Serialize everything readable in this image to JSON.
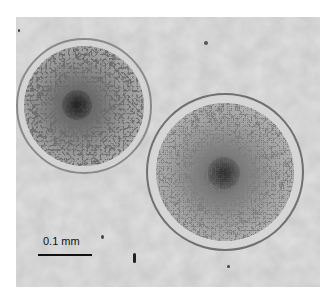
{
  "image": {
    "description": "Light micrograph of two round cells with reticulated surface texture",
    "background_color": "#cfcfcf",
    "cells": [
      {
        "name": "left-cell",
        "cx": 68,
        "cy": 106,
        "r": 68
      },
      {
        "name": "right-cell",
        "cx": 225,
        "cy": 180,
        "r": 79
      }
    ]
  },
  "scale_bar": {
    "label": "0.1 mm",
    "length_px": 54
  }
}
